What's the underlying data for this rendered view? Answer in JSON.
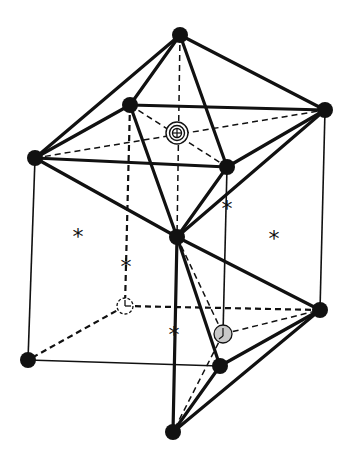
{
  "figure": {
    "marker_symbol": "*",
    "node_color": "#111111",
    "gray_site_color": "#c8c8c8"
  }
}
